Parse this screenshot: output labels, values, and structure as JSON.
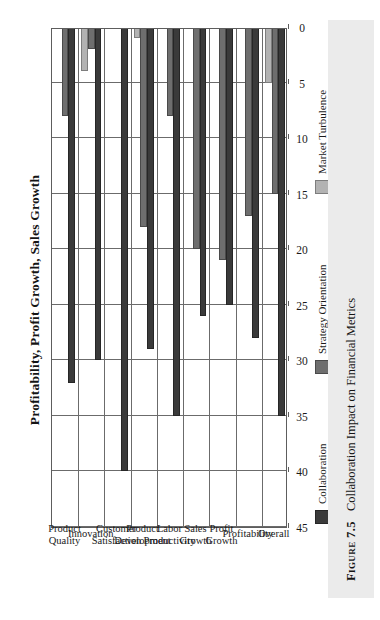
{
  "figure": {
    "number_label": "Figure 7.5",
    "caption": "Collaboration Impact on Financial Metrics"
  },
  "chart_data": {
    "type": "bar",
    "orientation": "horizontal-rotated",
    "title": "Profitability, Profit Growth, Sales Growth",
    "xlabel": "",
    "ylabel": "",
    "ylim": [
      0,
      45
    ],
    "grid": true,
    "legend_position": "bottom-left",
    "ticks": [
      "45",
      "40",
      "35",
      "30",
      "25",
      "20",
      "15",
      "10",
      "5",
      "0"
    ],
    "tick_values": [
      45,
      40,
      35,
      30,
      25,
      20,
      15,
      10,
      5,
      0
    ],
    "categories": [
      "Overall",
      "Profitability",
      "Profit Growth",
      "Sales Growth",
      "Labor Productivity",
      "Product Development",
      "Customer Satisfaction",
      "Innovation",
      "Product Quality"
    ],
    "category_lines": [
      [
        "Overall"
      ],
      [
        "Profitability"
      ],
      [
        "Profit",
        "Growth"
      ],
      [
        "Sales",
        "Growth"
      ],
      [
        "Labor",
        "Productivity"
      ],
      [
        "Product",
        "Development"
      ],
      [
        "Customer",
        "Satisfaction"
      ],
      [
        "Innovation"
      ],
      [
        "Product",
        "Quality"
      ]
    ],
    "series": [
      {
        "name": "Collaboration",
        "color": "#3a3a3a",
        "values": [
          35,
          28,
          25,
          26,
          35,
          29,
          40,
          30,
          32
        ]
      },
      {
        "name": "Strategy Orientation",
        "color": "#6e6e6e",
        "values": [
          15,
          17,
          21,
          20,
          8,
          18,
          0,
          2,
          8
        ]
      },
      {
        "name": "Market Turbulence",
        "color": "#b2b2b2",
        "values": [
          5,
          0,
          0,
          0,
          0,
          1,
          0,
          4,
          0
        ]
      }
    ]
  }
}
